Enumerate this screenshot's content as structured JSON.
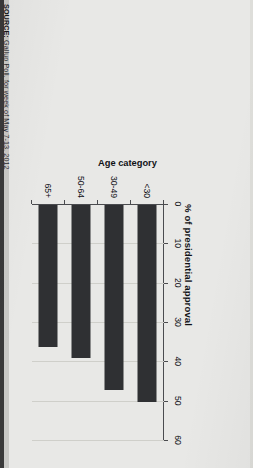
{
  "source": {
    "label": "SOURCE:",
    "text": " Gallup Poll, for week of May 7-13, 2012"
  },
  "axis_title": "Age category",
  "colors": {
    "bar": "#2f3033",
    "page_background": "#e8e8e6",
    "axis": "#4a4b4f",
    "gridline": "#cfcfca",
    "text": "#111216"
  },
  "chart_data": {
    "type": "bar",
    "orientation": "horizontal",
    "title": "% of presidential approval",
    "xlabel": "% of presidential approval",
    "ylabel": "Age category",
    "categories": [
      "<30",
      "30-49",
      "50-64",
      "65+"
    ],
    "values": [
      50,
      47,
      39,
      36
    ],
    "xlim": [
      0,
      60
    ],
    "xticks": [
      0,
      10,
      20,
      30,
      40,
      50,
      60
    ],
    "xtick_labels": [
      "0",
      "10",
      "20",
      "30",
      "40",
      "50",
      "60"
    ],
    "grid": true,
    "legend": "none",
    "series": [
      {
        "name": "% of presidential approval",
        "values": [
          50,
          47,
          39,
          36
        ]
      }
    ]
  }
}
